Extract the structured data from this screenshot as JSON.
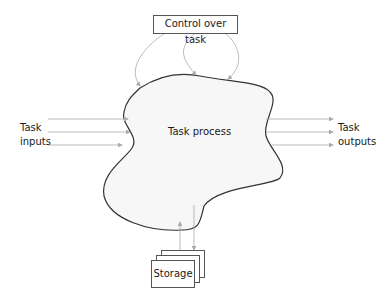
{
  "diagram": {
    "control": {
      "label": "Control over task"
    },
    "process": {
      "label": "Task process",
      "fill": "#f7f7f7",
      "stroke": "#333333"
    },
    "inputs": {
      "line1": "Task",
      "line2": "inputs",
      "arrow_count": 3
    },
    "outputs": {
      "line1": "Task",
      "line2": "outputs",
      "arrow_count": 3
    },
    "storage": {
      "label": "Storage",
      "stack_count": 3
    },
    "arrow_color": "#aaaaaa"
  }
}
